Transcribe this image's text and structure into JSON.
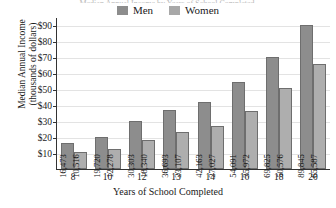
{
  "title_sliver": "Median Annual Income by Years of School Completed",
  "legend": {
    "items": [
      {
        "label": "Men",
        "color": "#8d8d8d"
      },
      {
        "label": "Women",
        "color": "#a8a8a8"
      }
    ]
  },
  "axes": {
    "ylabel_line1": "Median Annual Income",
    "ylabel_line2": "(thousands of dollars)",
    "xlabel": "Years of School Completed",
    "yticks": [
      "$10",
      "$20",
      "$30",
      "$40",
      "$50",
      "$60",
      "$70",
      "$80",
      "$90"
    ]
  },
  "chart_data": {
    "type": "bar",
    "title": "Median Annual Income by Years of School Completed",
    "xlabel": "Years of School Completed",
    "ylabel": "Median Annual Income (thousands of dollars)",
    "categories": [
      "8",
      "10",
      "12",
      "13",
      "14",
      "16",
      "18",
      "20"
    ],
    "series": [
      {
        "name": "Men",
        "color": "#8d8d8d",
        "values": [
          16473,
          19720,
          30303,
          36693,
          42163,
          54091,
          69825,
          89845
        ],
        "labels": [
          "16,473",
          "19,720",
          "30,303",
          "36,693",
          "42,163",
          "54,091",
          "69,825",
          "89,845"
        ]
      },
      {
        "name": "Women",
        "color": "#aeaeae",
        "values": [
          10516,
          12278,
          18340,
          23107,
          27027,
          35972,
          50576,
          65587
        ],
        "labels": [
          "10,516",
          "12,278",
          "18,340",
          "23,107",
          "27,027",
          "35,972",
          "50,576",
          "65,587"
        ]
      }
    ],
    "ylim": [
      0,
      95000
    ],
    "ytick_values": [
      10000,
      20000,
      30000,
      40000,
      50000,
      60000,
      70000,
      80000,
      90000
    ],
    "ytick_labels": [
      "$10",
      "$20",
      "$30",
      "$40",
      "$50",
      "$60",
      "$70",
      "$80",
      "$90"
    ],
    "grid": true,
    "legend_position": "top-center",
    "value_labels": "rotated-vertical-inside-bar"
  }
}
